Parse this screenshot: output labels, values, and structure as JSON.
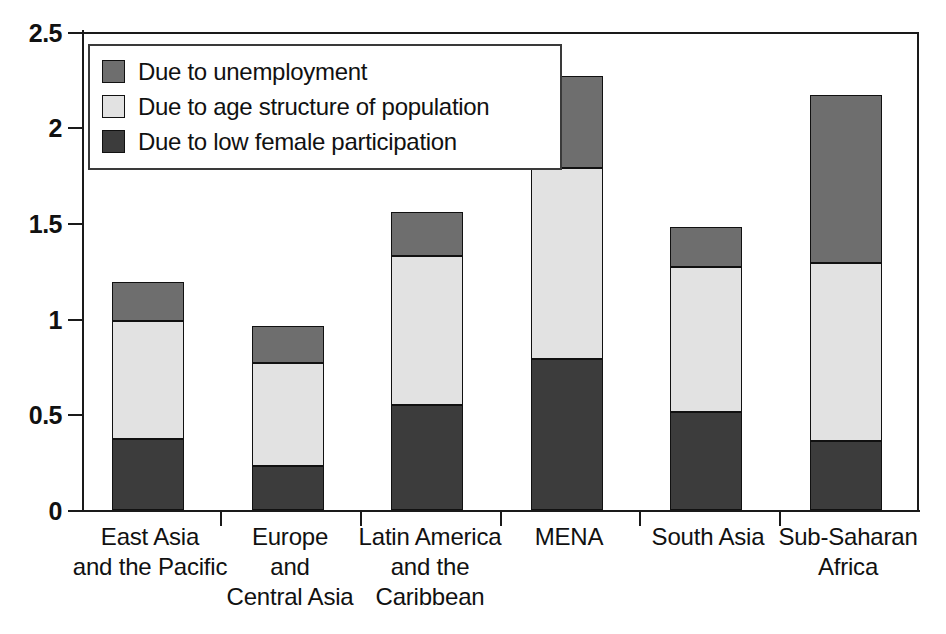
{
  "chart_data": {
    "type": "bar",
    "subtype": "stacked-bar",
    "title": "",
    "subtitle": "",
    "xlabel": "",
    "ylabel": "",
    "ylim": [
      0,
      2.5
    ],
    "yticks": [
      0,
      0.5,
      1,
      1.5,
      2,
      2.5
    ],
    "ytick_labels": [
      "0",
      "0.5",
      "1",
      "1.5",
      "2",
      "2.5"
    ],
    "grid": false,
    "legend_position": "upper-left-inside",
    "categories": [
      "East Asia and the Pacific",
      "Europe and Central Asia",
      "Latin America and the Caribbean",
      "MENA",
      "South Asia",
      "Sub-Saharan Africa"
    ],
    "category_label_lines": [
      [
        "East Asia",
        "and the Pacific"
      ],
      [
        "Europe",
        "and",
        "Central Asia"
      ],
      [
        "Latin America",
        "and the",
        "Caribbean"
      ],
      [
        "MENA"
      ],
      [
        "South Asia"
      ],
      [
        "Sub-Saharan",
        "Africa"
      ]
    ],
    "series": [
      {
        "name": "Due to low female participation",
        "color": "#3c3c3c",
        "values": [
          0.37,
          0.23,
          0.55,
          0.79,
          0.51,
          0.36
        ]
      },
      {
        "name": "Due to age structure of population",
        "color": "#e2e2e2",
        "values": [
          0.62,
          0.54,
          0.78,
          1.0,
          0.76,
          0.93
        ]
      },
      {
        "name": "Due to unemployment",
        "color": "#6e6e6e",
        "values": [
          0.2,
          0.19,
          0.23,
          0.48,
          0.21,
          0.88
        ]
      }
    ],
    "totals": [
      1.19,
      0.96,
      1.56,
      2.27,
      1.47,
      2.17
    ],
    "stack_order_bottom_to_top": [
      "Due to low female participation",
      "Due to age structure of population",
      "Due to unemployment"
    ]
  },
  "legend": {
    "items": [
      {
        "label": "Due to unemployment",
        "color": "#6e6e6e"
      },
      {
        "label": "Due to age structure of population",
        "color": "#e2e2e2"
      },
      {
        "label": "Due to low female participation",
        "color": "#3c3c3c"
      }
    ]
  },
  "axis": {
    "y_tick_labels": [
      "2.5",
      "2",
      "1.5",
      "1",
      "0.5",
      "0"
    ]
  },
  "caption": {
    "fragment": ""
  }
}
